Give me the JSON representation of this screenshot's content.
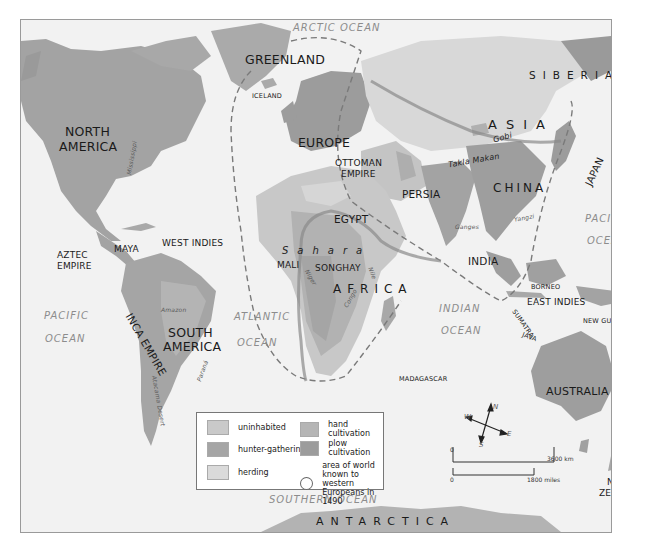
{
  "map": {
    "title_labels": {
      "oceans": [
        {
          "id": "arctic",
          "label": "ARCTIC OCEAN"
        },
        {
          "id": "pacific-west-1",
          "label": "PACIFIC"
        },
        {
          "id": "pacific-west-2",
          "label": "OCEAN"
        },
        {
          "id": "atlantic-1",
          "label": "ATLANTIC"
        },
        {
          "id": "atlantic-2",
          "label": "OCEAN"
        },
        {
          "id": "indian-1",
          "label": "INDIAN"
        },
        {
          "id": "indian-2",
          "label": "OCEAN"
        },
        {
          "id": "pacific-east-1",
          "label": "PACIFIC"
        },
        {
          "id": "pacific-east-2",
          "label": "OCEAN"
        },
        {
          "id": "southern",
          "label": "SOUTHERN OCEAN"
        }
      ]
    },
    "regions": {
      "greenland": "GREENLAND",
      "iceland": "ICELAND",
      "north_america_1": "NORTH",
      "north_america_2": "AMERICA",
      "europe": "EUROPE",
      "ottoman_1": "OTTOMAN",
      "ottoman_2": "EMPIRE",
      "siberia": "SIBERIA",
      "asia": "ASIA",
      "gobi": "Gobi",
      "takla_makan": "Takla Makan",
      "china": "CHINA",
      "japan": "JAPAN",
      "persia": "PERSIA",
      "egypt": "EGYPT",
      "sahara": "Sahara",
      "mali": "MALI",
      "songhay": "SONGHAY",
      "africa": "AFRICA",
      "india": "INDIA",
      "aztec_1": "AZTEC",
      "aztec_2": "EMPIRE",
      "maya": "MAYA",
      "west_indies": "WEST INDIES",
      "south_america_1": "SOUTH",
      "south_america_2": "AMERICA",
      "inca_empire": "INCA EMPIRE",
      "atacama": "Atacama Desert",
      "madagascar": "MADAGASCAR",
      "borneo": "BORNEO",
      "east_indies": "EAST INDIES",
      "sumatra": "SUMATRA",
      "java": "JAVA",
      "new_guinea": "NEW GUINEA",
      "australia": "AUSTRALIA",
      "new_zealand_1": "NEW",
      "new_zealand_2": "ZEALAND",
      "antarctica": "ANTARCTICA"
    },
    "rivers": {
      "mississippi": "Mississippi",
      "amazon": "Amazon",
      "parana": "Paraná",
      "nile": "Nile",
      "niger": "Niger",
      "congo": "Congo",
      "ganges": "Ganges",
      "yangzi": "Yangzi"
    }
  },
  "legend": {
    "items": [
      {
        "label": "uninhabited",
        "color": "#c9c9c9"
      },
      {
        "label": "hunter-gathering",
        "color": "#a5a5a5"
      },
      {
        "label": "herding",
        "color": "#dadada"
      },
      {
        "label": "hand cultivation",
        "color": "#b5b5b5"
      },
      {
        "label": "plow cultivation",
        "color": "#9c9c9c"
      },
      {
        "label": "area of world known to",
        "label2": "western Europeans in 1490",
        "color": "#ffffff"
      }
    ]
  },
  "compass": {
    "n": "N",
    "s": "S",
    "e": "E",
    "w": "W"
  },
  "scale": {
    "km_start": "0",
    "km_end": "3600 km",
    "mi_start": "0",
    "mi_end": "1800 miles"
  },
  "colors": {
    "ocean": "#f2f2f2",
    "land_plow": "#9c9c9c",
    "land_hand": "#b3b3b3",
    "land_hunter": "#a5a5a5",
    "land_herding": "#d9d9d9",
    "land_uninhabited": "#c8c8c8",
    "known_world_line": "#7a7a7a"
  }
}
